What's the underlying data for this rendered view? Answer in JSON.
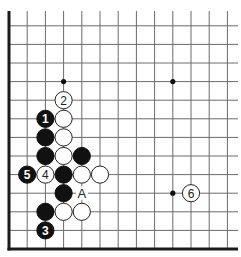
{
  "diagram": {
    "type": "go-board-partial",
    "grid": {
      "origin_x": 9,
      "origin_y": 249,
      "col_spacing": 18.2,
      "row_spacing": 18.6,
      "columns": 13,
      "rows": 13,
      "edges": [
        "left",
        "bottom"
      ]
    },
    "star_points": [
      {
        "col": 3,
        "row": 9
      },
      {
        "col": 9,
        "row": 9
      },
      {
        "col": 9,
        "row": 3
      }
    ],
    "stones": [
      {
        "color": "black",
        "col": 2,
        "row": 7,
        "label": "1"
      },
      {
        "color": "white",
        "col": 3,
        "row": 8,
        "label": "2"
      },
      {
        "color": "black",
        "col": 2,
        "row": 1,
        "label": "3"
      },
      {
        "color": "white",
        "col": 2,
        "row": 4,
        "label": "4"
      },
      {
        "color": "black",
        "col": 1,
        "row": 4,
        "label": "5"
      },
      {
        "color": "white",
        "col": 10,
        "row": 3,
        "label": "6"
      },
      {
        "color": "white",
        "col": 3,
        "row": 7,
        "label": ""
      },
      {
        "color": "black",
        "col": 2,
        "row": 6,
        "label": ""
      },
      {
        "color": "white",
        "col": 3,
        "row": 6,
        "label": ""
      },
      {
        "color": "black",
        "col": 2,
        "row": 5,
        "label": ""
      },
      {
        "color": "white",
        "col": 3,
        "row": 5,
        "label": ""
      },
      {
        "color": "black",
        "col": 4,
        "row": 5,
        "label": ""
      },
      {
        "color": "black",
        "col": 3,
        "row": 4,
        "label": ""
      },
      {
        "color": "white",
        "col": 4,
        "row": 4,
        "label": ""
      },
      {
        "color": "white",
        "col": 5,
        "row": 4,
        "label": ""
      },
      {
        "color": "black",
        "col": 3,
        "row": 3,
        "label": ""
      },
      {
        "color": "black",
        "col": 2,
        "row": 2,
        "label": ""
      },
      {
        "color": "white",
        "col": 3,
        "row": 2,
        "label": ""
      },
      {
        "color": "white",
        "col": 4,
        "row": 2,
        "label": ""
      }
    ],
    "markers": [
      {
        "col": 4,
        "row": 3,
        "text": "A"
      }
    ],
    "colors": {
      "black_stone": "#111111",
      "white_stone": "#ffffff",
      "grid": "#6a6a6a",
      "edge": "#1a1a1a"
    }
  }
}
